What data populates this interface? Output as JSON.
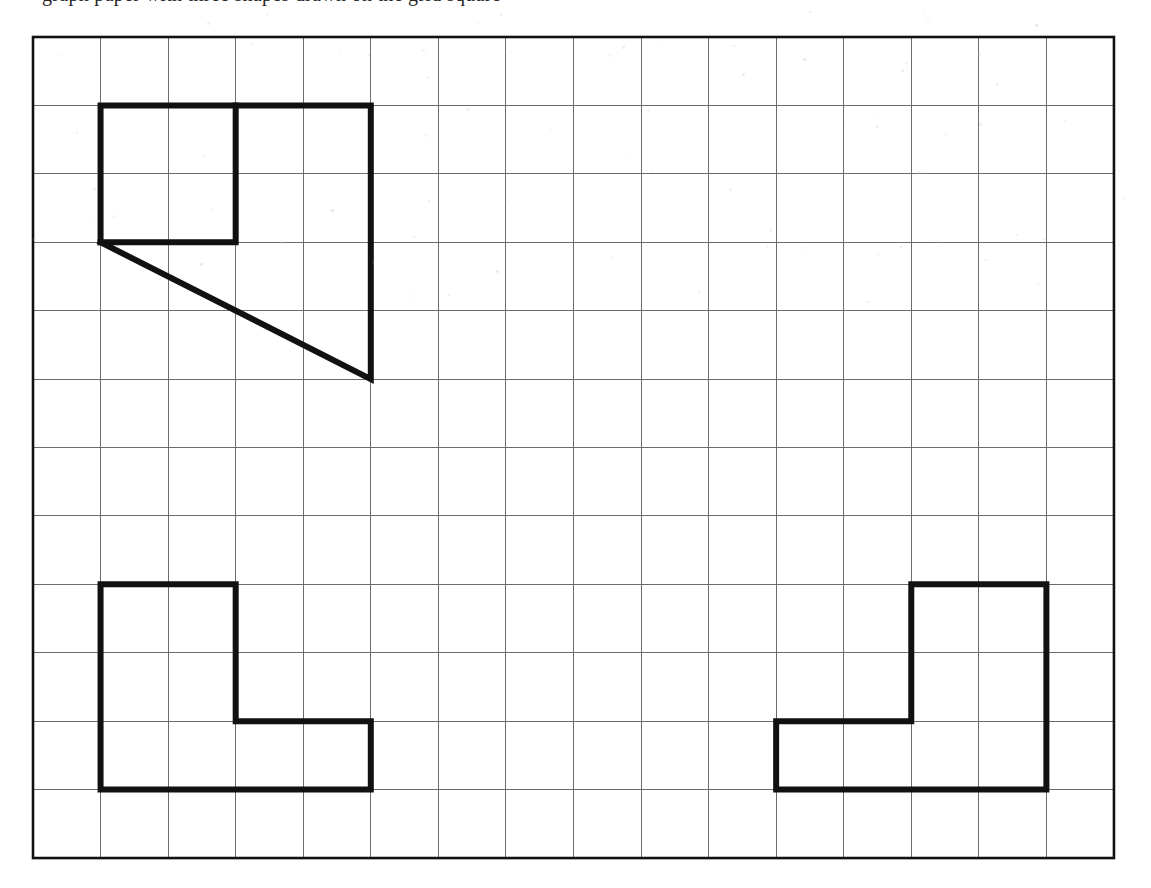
{
  "page": {
    "width": 1151,
    "height": 888,
    "background_color": "#ffffff",
    "clipped_header_text": "graph paper with three shapes drawn on the grid square"
  },
  "figure": {
    "grid": {
      "origin_x": 33,
      "origin_y": 37,
      "columns": 16,
      "rows": 12,
      "cell_width": 67.56,
      "cell_height": 68.42,
      "line_color": "#6d6d6d",
      "line_width": 1,
      "border_color": "#111111",
      "border_width": 2.6
    },
    "shape_style": {
      "stroke_color": "#111111",
      "stroke_width": 6,
      "fill": "none",
      "linecap": "square",
      "linejoin": "miter"
    },
    "shapes": [
      {
        "name": "top-left-figure",
        "label": "square with extended top edge, right leg and diagonal",
        "paths": [
          {
            "name": "outer-outline",
            "closed": false,
            "points": [
              [
                1,
                3
              ],
              [
                1,
                1
              ],
              [
                5,
                1
              ],
              [
                5,
                5
              ],
              [
                1,
                3
              ]
            ]
          },
          {
            "name": "inner-square-right-and-bottom",
            "closed": false,
            "points": [
              [
                3,
                1
              ],
              [
                3,
                3
              ],
              [
                1,
                3
              ]
            ]
          }
        ]
      },
      {
        "name": "bottom-left-l-shape",
        "label": "L-shaped polygon, foot pointing right",
        "paths": [
          {
            "name": "l-outline",
            "closed": true,
            "points": [
              [
                1,
                8
              ],
              [
                3,
                8
              ],
              [
                3,
                10
              ],
              [
                5,
                10
              ],
              [
                5,
                11
              ],
              [
                1,
                11
              ]
            ]
          }
        ]
      },
      {
        "name": "bottom-right-l-shape",
        "label": "mirrored L-shaped polygon, foot pointing left",
        "paths": [
          {
            "name": "mirrored-l-outline",
            "closed": true,
            "points": [
              [
                13,
                8
              ],
              [
                15,
                8
              ],
              [
                15,
                11
              ],
              [
                11,
                11
              ],
              [
                11,
                10
              ],
              [
                13,
                10
              ]
            ]
          }
        ]
      }
    ]
  }
}
